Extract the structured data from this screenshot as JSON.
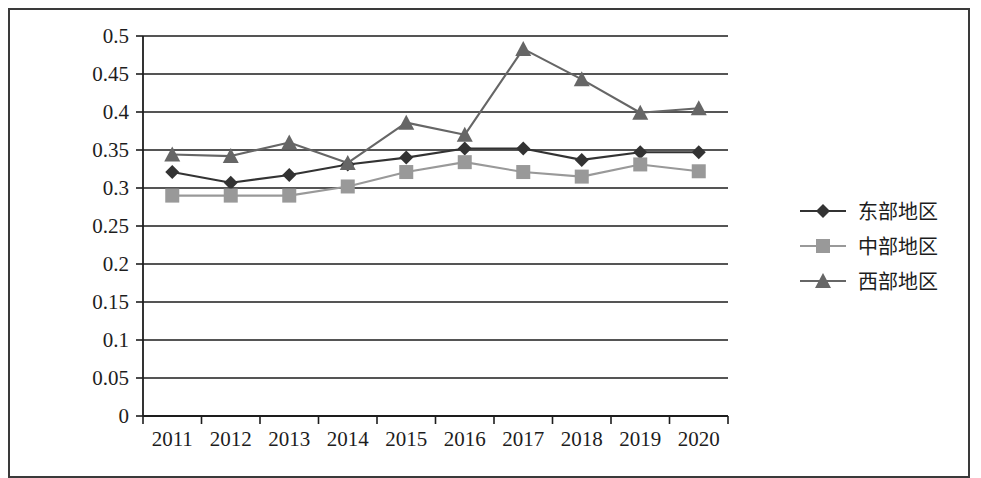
{
  "chart_data": {
    "type": "line",
    "title": "",
    "xlabel": "",
    "ylabel": "",
    "categories": [
      "2011",
      "2012",
      "2013",
      "2014",
      "2015",
      "2016",
      "2017",
      "2018",
      "2019",
      "2020"
    ],
    "ylim": [
      0,
      0.5
    ],
    "ytick_step": 0.05,
    "yticks": [
      "0",
      "0.05",
      "0.1",
      "0.15",
      "0.2",
      "0.25",
      "0.3",
      "0.35",
      "0.4",
      "0.45",
      "0.5"
    ],
    "ytick_values": [
      0,
      0.05,
      0.1,
      0.15,
      0.2,
      0.25,
      0.3,
      0.35,
      0.4,
      0.45,
      0.5
    ],
    "grid": "horizontal",
    "legend_position": "right",
    "series": [
      {
        "name": "东部地区",
        "marker": "diamond",
        "color": "#333333",
        "line_style": "solid",
        "values": [
          0.321,
          0.307,
          0.317,
          0.331,
          0.34,
          0.352,
          0.352,
          0.337,
          0.347,
          0.347
        ]
      },
      {
        "name": "中部地区",
        "marker": "square",
        "color": "#999999",
        "line_style": "solid",
        "values": [
          0.29,
          0.29,
          0.29,
          0.302,
          0.321,
          0.334,
          0.321,
          0.315,
          0.331,
          0.322
        ]
      },
      {
        "name": "西部地区",
        "marker": "triangle",
        "color": "#666666",
        "line_style": "solid",
        "values": [
          0.344,
          0.342,
          0.36,
          0.333,
          0.386,
          0.37,
          0.483,
          0.443,
          0.399,
          0.405
        ]
      }
    ]
  },
  "legend": {
    "items": [
      {
        "label": "东部地区",
        "marker": "diamond",
        "color": "#333333"
      },
      {
        "label": "中部地区",
        "marker": "square",
        "color": "#999999"
      },
      {
        "label": "西部地区",
        "marker": "triangle",
        "color": "#666666"
      }
    ]
  },
  "colors": {
    "frame": "#3a3a3a",
    "axis": "#1d1d1d",
    "gridline": "#1d1d1d",
    "background": "#ffffff"
  }
}
